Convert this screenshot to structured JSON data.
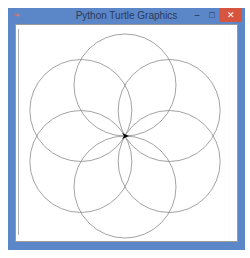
{
  "window": {
    "title": "Python Turtle Graphics",
    "icons": {
      "app": "python-feather-icon",
      "minimize": "minimize-icon",
      "maximize": "maximize-icon",
      "close": "close-icon"
    },
    "glyphs": {
      "app": "❧",
      "minimize": "–",
      "maximize": "□",
      "close": "✕"
    }
  },
  "drawing": {
    "shape": "flower of six overlapping circles",
    "circle_count": 6,
    "stroke_color": "#8c8c8c",
    "turtle_color": "#000000",
    "turtle_heading": "east"
  }
}
